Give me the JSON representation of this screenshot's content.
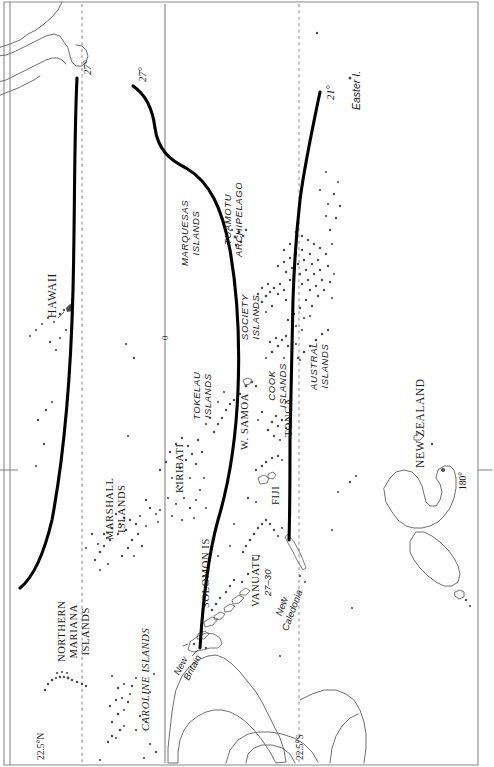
{
  "map": {
    "title": "Pacific Ocean island groups with isochrone contours",
    "orientation": "rotated-90",
    "frame_color": "#7a7a7a",
    "coast_color": "#6e6e6e",
    "contour_color": "#000000",
    "island_dot_color": "#444444",
    "graticule": {
      "equator_label": "0",
      "dashed_lines": [
        {
          "name": "lat-22-5-N",
          "label": "22.5°N"
        },
        {
          "name": "lat-22-5-S",
          "label": "22.5°S"
        }
      ],
      "meridian": {
        "name": "lon-180",
        "label": "180°"
      }
    },
    "contours": [
      {
        "name": "contour-west",
        "label": "27°"
      },
      {
        "name": "contour-middle",
        "label": "27°"
      },
      {
        "name": "contour-east",
        "label": "21°"
      }
    ],
    "labels": [
      {
        "id": "hawaii",
        "text": "HAWAII",
        "style": "serif-caps"
      },
      {
        "id": "northern-mariana",
        "text": "NORTHERN\nMARIANA\nISLANDS",
        "style": "serif-caps"
      },
      {
        "id": "caroline",
        "text": "CAROLINE ISLANDS",
        "style": "serif-caps"
      },
      {
        "id": "marshall",
        "text": "MARSHALL\nISLANDS",
        "style": "serif-caps"
      },
      {
        "id": "kiribati",
        "text": "KIRIBATI",
        "style": "serif-caps"
      },
      {
        "id": "solomon",
        "text": "SOLOMON IS",
        "style": "serif-caps"
      },
      {
        "id": "new-britain",
        "text": "New\nBritain",
        "style": "sans-italic"
      },
      {
        "id": "vanuatu",
        "text": "VANUATU",
        "style": "serif-caps"
      },
      {
        "id": "vanuatu-value",
        "text": "27–30",
        "style": "sans-italic"
      },
      {
        "id": "new-caledonia",
        "text": "New\nCaledonia",
        "style": "sans-italic"
      },
      {
        "id": "fiji",
        "text": "FIJI",
        "style": "serif-caps"
      },
      {
        "id": "tonga",
        "text": "TONGA",
        "style": "serif-caps"
      },
      {
        "id": "w-samoa",
        "text": "W. SAMOA",
        "style": "serif-caps"
      },
      {
        "id": "tokelau",
        "text": "TOKELAU\nISLANDS",
        "style": "sans-italic-caps"
      },
      {
        "id": "cook",
        "text": "COOK\nISLANDS",
        "style": "sans-italic-caps"
      },
      {
        "id": "society",
        "text": "SOCIETY\nISLANDS",
        "style": "sans-italic-caps"
      },
      {
        "id": "marquesas",
        "text": "MARQUESAS\nISLANDS",
        "style": "sans-italic-caps"
      },
      {
        "id": "tuamotu",
        "text": "TUAMOTU\nARCHIPELAGO",
        "style": "sans-italic-caps"
      },
      {
        "id": "austral",
        "text": "AUSTRAL\nISLANDS",
        "style": "sans-italic-caps"
      },
      {
        "id": "easter",
        "text": "Easter I.",
        "style": "sans-italic"
      },
      {
        "id": "new-zealand",
        "text": "NEW ZEALAND",
        "style": "serif-caps"
      }
    ],
    "text": {
      "hawaii": "HAWAII",
      "northern_mariana_1": "NORTHERN",
      "northern_mariana_2": "MARIANA",
      "northern_mariana_3": "ISLANDS",
      "caroline": "CAROLINE ISLANDS",
      "marshall_1": "MARSHALL",
      "marshall_2": "ISLANDS",
      "kiribati": "KIRIBATI",
      "solomon": "SOLOMON IS",
      "new_britain_1": "New",
      "new_britain_2": "Britain",
      "vanuatu": "VANUATU",
      "vanuatu_value": "27–30",
      "new_caledonia_1": "New",
      "new_caledonia_2": "Caledonia",
      "fiji": "FIJI",
      "tonga": "TONGA",
      "w_samoa": "W. SAMOA",
      "tokelau_1": "TOKELAU",
      "tokelau_2": "ISLANDS",
      "cook_1": "COOK",
      "cook_2": "ISLANDS",
      "society_1": "SOCIETY",
      "society_2": "ISLANDS",
      "marquesas_1": "MARQUESAS",
      "marquesas_2": "ISLANDS",
      "tuamotu_1": "TUAMOTU",
      "tuamotu_2": "ARCHIPELAGO",
      "austral_1": "AUSTRAL",
      "austral_2": "ISLANDS",
      "easter": "Easter I.",
      "new_zealand": "NEW ZEALAND",
      "contour_west": "27°",
      "contour_middle": "27°",
      "contour_east": "21°",
      "lat_north": "22.5°N",
      "lat_south": "22.5°S",
      "lon_180": "180°",
      "equator": "0"
    }
  }
}
